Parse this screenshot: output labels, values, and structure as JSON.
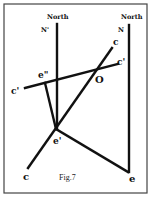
{
  "figure": {
    "caption": "Fig.7",
    "labels": {
      "north_left": "North",
      "north_right": "North",
      "n_prime": "N'",
      "n": "N",
      "c_top": "c",
      "c_prime_right": "c'",
      "o": "O",
      "e_double_prime": "e\"",
      "c_prime_left": "c'",
      "e_prime": "e'",
      "c_bottom": "c",
      "e": "e"
    },
    "colors": {
      "line": "#111111",
      "border": "#444444",
      "background": "#ffffff"
    }
  }
}
